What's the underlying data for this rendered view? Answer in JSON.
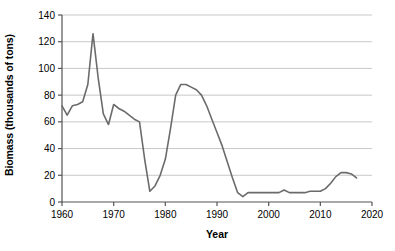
{
  "chart_data": {
    "type": "line",
    "title": "",
    "xlabel": "Year",
    "ylabel": "Biomass (thousands of tons)",
    "xlim": [
      1960,
      2020
    ],
    "ylim": [
      0,
      140
    ],
    "xticks": [
      1960,
      1970,
      1980,
      1990,
      2000,
      2010,
      2020
    ],
    "yticks": [
      0,
      20,
      40,
      60,
      80,
      100,
      120,
      140
    ],
    "grid": "horizontal",
    "legend": "none",
    "line_color": "#6b6b6b",
    "grid_color": "#c8c8c8",
    "axis_color": "#555555",
    "background_color": "#ffffff",
    "series": [
      {
        "name": "Biomass",
        "x": [
          1960,
          1961,
          1962,
          1963,
          1964,
          1965,
          1966,
          1967,
          1968,
          1969,
          1970,
          1971,
          1972,
          1973,
          1974,
          1975,
          1976,
          1977,
          1978,
          1979,
          1980,
          1981,
          1982,
          1983,
          1984,
          1985,
          1986,
          1987,
          1988,
          1989,
          1990,
          1991,
          1992,
          1993,
          1994,
          1995,
          1996,
          1997,
          1998,
          1999,
          2000,
          2001,
          2002,
          2003,
          2004,
          2005,
          2006,
          2007,
          2008,
          2009,
          2010,
          2011,
          2012,
          2013,
          2014,
          2015,
          2016,
          2017
        ],
        "values": [
          72,
          65,
          72,
          73,
          75,
          88,
          126,
          93,
          66,
          58,
          73,
          70,
          68,
          65,
          62,
          60,
          32,
          8,
          12,
          20,
          32,
          55,
          80,
          88,
          88,
          86,
          84,
          80,
          72,
          62,
          52,
          42,
          30,
          18,
          7,
          4,
          7,
          7,
          7,
          7,
          7,
          7,
          7,
          9,
          7,
          7,
          7,
          7,
          8,
          8,
          8,
          10,
          14,
          19,
          22,
          22,
          21,
          18
        ]
      }
    ]
  },
  "axis": {
    "y_tick_labels": [
      "0",
      "20",
      "40",
      "60",
      "80",
      "100",
      "120",
      "140"
    ],
    "x_tick_labels": [
      "1960",
      "1970",
      "1980",
      "1990",
      "2000",
      "2010",
      "2020"
    ]
  }
}
